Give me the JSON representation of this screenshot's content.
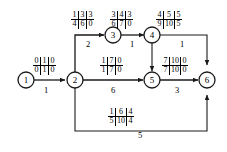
{
  "diagram": {
    "type": "activity-network-flow-diagram",
    "nodes": [
      {
        "id": "n1",
        "label": "1",
        "x": 26,
        "y": 80
      },
      {
        "id": "n2",
        "label": "2",
        "x": 75,
        "y": 80
      },
      {
        "id": "n3",
        "label": "3",
        "x": 113,
        "y": 35
      },
      {
        "id": "n4",
        "label": "4",
        "x": 152,
        "y": 35
      },
      {
        "id": "n5",
        "label": "5",
        "x": 152,
        "y": 80
      },
      {
        "id": "n6",
        "label": "6",
        "x": 207,
        "y": 80
      }
    ],
    "edges": [
      {
        "id": "e12",
        "from": "1",
        "to": "2",
        "weight": "1"
      },
      {
        "id": "e23",
        "from": "2",
        "to": "3",
        "weight": "2"
      },
      {
        "id": "e34",
        "from": "3",
        "to": "4",
        "weight": "1"
      },
      {
        "id": "e46",
        "from": "4",
        "to": "6",
        "weight": "1"
      },
      {
        "id": "e45",
        "from": "4",
        "to": "5",
        "weight": ""
      },
      {
        "id": "e25",
        "from": "2",
        "to": "5",
        "weight": "6"
      },
      {
        "id": "e56",
        "from": "5",
        "to": "6",
        "weight": "3"
      },
      {
        "id": "e26",
        "from": "2",
        "to": "6",
        "weight": "5"
      }
    ],
    "labels": [
      {
        "id": "L12",
        "edge": "1-2",
        "top": [
          "0",
          "1",
          "0"
        ],
        "bottom": [
          "0",
          "1",
          "0"
        ]
      },
      {
        "id": "L23",
        "edge": "2-3",
        "top": [
          "1",
          "3",
          "3"
        ],
        "bottom": [
          "4",
          "6",
          "0"
        ]
      },
      {
        "id": "L34",
        "edge": "3-4",
        "top": [
          "3",
          "4",
          "3"
        ],
        "bottom": [
          "6",
          "7",
          "0"
        ]
      },
      {
        "id": "L46",
        "edge": "4-6",
        "top": [
          "4",
          "5",
          "5"
        ],
        "bottom": [
          "9",
          "10",
          "5"
        ]
      },
      {
        "id": "L25",
        "edge": "2-5",
        "top": [
          "1",
          "7",
          "0"
        ],
        "bottom": [
          "1",
          "7",
          "0"
        ]
      },
      {
        "id": "L56",
        "edge": "5-6",
        "top": [
          "7",
          "10",
          "0"
        ],
        "bottom": [
          "7",
          "10",
          "0"
        ]
      },
      {
        "id": "L26",
        "edge": "2-6",
        "top": [
          "1",
          "6",
          "4"
        ],
        "bottom": [
          "5",
          "10",
          "4"
        ]
      }
    ],
    "colors": {
      "stroke": "#1a1a1a",
      "text": "#000000",
      "background": "#ffffff"
    }
  }
}
